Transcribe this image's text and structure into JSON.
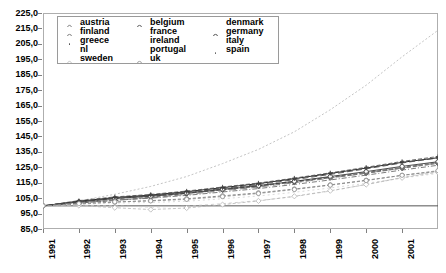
{
  "chart_data": {
    "type": "line",
    "title": "",
    "subtitle": "",
    "xlabel": "",
    "ylabel": "",
    "grid": false,
    "legend_position": "top-left",
    "xlim": [
      1991,
      2002
    ],
    "ylim": [
      85.0,
      225.0
    ],
    "ytick_step": 10.0,
    "y_ticks": [
      "225,0",
      "215,0",
      "205,0",
      "195,0",
      "185,0",
      "175,0",
      "165,0",
      "155,0",
      "145,0",
      "135,0",
      "125,0",
      "115,0",
      "105,0",
      "95,0",
      "85,0"
    ],
    "y_tick_values": [
      225,
      215,
      205,
      195,
      185,
      175,
      165,
      155,
      145,
      135,
      125,
      115,
      105,
      95,
      85
    ],
    "x_ticks": [
      "1991",
      "1992",
      "1993",
      "1994",
      "1995",
      "1996",
      "1997",
      "1998",
      "1999",
      "2000",
      "2001"
    ],
    "x_tick_values": [
      1991,
      1992,
      1993,
      1994,
      1995,
      1996,
      1997,
      1998,
      1999,
      2000,
      2001
    ],
    "x": [
      1991,
      1992,
      1993,
      1994,
      1995,
      1996,
      1997,
      1998,
      1999,
      2000,
      2001,
      2002
    ],
    "series": [
      {
        "name": "austria",
        "marker": "open-diamond",
        "dash": "4,2",
        "color": "#555555",
        "width": 0.8,
        "values": [
          100.0,
          101.8,
          103.5,
          105.6,
          108.0,
          110.3,
          112.7,
          115.4,
          118.2,
          121.1,
          124.4,
          127.5
        ]
      },
      {
        "name": "belgium",
        "marker": "open-circle",
        "dash": "4,2",
        "color": "#444444",
        "width": 0.8,
        "values": [
          100.0,
          102.4,
          104.6,
          106.5,
          108.6,
          110.9,
          113.2,
          115.8,
          118.6,
          121.6,
          124.9,
          128.1
        ]
      },
      {
        "name": "denmark",
        "marker": "none",
        "dash": "2,2",
        "color": "#bdbdbd",
        "width": 0.9,
        "values": [
          100.0,
          103.2,
          107.5,
          112.6,
          119.0,
          127.4,
          136.6,
          148.0,
          162.3,
          178.2,
          196.6,
          213.8
        ]
      },
      {
        "name": "finland",
        "marker": "open-circle",
        "dash": "3,2",
        "color": "#6b6b6b",
        "width": 0.8,
        "values": [
          100.0,
          101.2,
          102.4,
          103.4,
          104.6,
          106.5,
          108.4,
          110.9,
          113.6,
          116.6,
          119.8,
          122.4
        ]
      },
      {
        "name": "france",
        "marker": "none",
        "dash": "5,2,1,2",
        "color": "#5a5a5a",
        "width": 0.8,
        "values": [
          100.0,
          102.0,
          103.6,
          105.0,
          106.8,
          109.0,
          111.2,
          113.9,
          116.8,
          119.9,
          123.2,
          126.3
        ]
      },
      {
        "name": "germany",
        "marker": "open-circle",
        "dash": "none",
        "color": "#3a3a3a",
        "width": 0.9,
        "values": [
          100.0,
          102.6,
          104.8,
          106.2,
          108.2,
          110.6,
          113.0,
          115.9,
          119.0,
          122.2,
          125.6,
          128.6
        ]
      },
      {
        "name": "greece",
        "marker": "plus",
        "dash": "none",
        "color": "#2b2b2b",
        "width": 1.0,
        "values": [
          100.0,
          103.0,
          105.4,
          107.0,
          109.2,
          111.8,
          114.4,
          117.6,
          121.0,
          124.5,
          128.2,
          131.2
        ]
      },
      {
        "name": "ireland",
        "marker": "none",
        "dash": "3,3",
        "color": "#c4c4c4",
        "width": 0.8,
        "values": [
          100.0,
          100.4,
          100.0,
          99.2,
          99.8,
          101.4,
          103.4,
          106.0,
          109.6,
          113.9,
          118.4,
          122.6
        ]
      },
      {
        "name": "italy",
        "marker": "none",
        "dash": "6,3",
        "color": "#4a4a4a",
        "width": 0.9,
        "values": [
          100.0,
          102.8,
          105.0,
          106.6,
          108.8,
          111.2,
          113.8,
          117.0,
          120.4,
          124.0,
          127.8,
          131.0
        ]
      },
      {
        "name": "nl",
        "marker": "none",
        "dash": "2,3",
        "color": "#cfcfcf",
        "width": 0.8,
        "values": [
          100.0,
          101.0,
          101.8,
          102.2,
          103.0,
          104.6,
          106.4,
          108.8,
          111.6,
          114.6,
          118.0,
          121.0
        ]
      },
      {
        "name": "portugal",
        "marker": "none",
        "dash": "7,4",
        "color": "#7a7a7a",
        "width": 0.9,
        "values": [
          100.0,
          102.2,
          103.8,
          105.2,
          107.4,
          109.8,
          112.2,
          115.0,
          118.0,
          121.2,
          124.6,
          127.8
        ]
      },
      {
        "name": "spain",
        "marker": "plus",
        "dash": "4,2",
        "color": "#464646",
        "width": 0.8,
        "values": [
          100.0,
          103.4,
          105.8,
          107.4,
          109.6,
          112.2,
          114.8,
          118.0,
          121.4,
          125.0,
          128.8,
          132.0
        ]
      },
      {
        "name": "sweden",
        "marker": "open-diamond",
        "dash": "3,2",
        "color": "#b5b5b5",
        "width": 0.8,
        "values": [
          100.0,
          100.2,
          98.8,
          97.6,
          98.6,
          100.8,
          103.2,
          106.2,
          109.8,
          113.8,
          118.2,
          121.8
        ]
      },
      {
        "name": "uk",
        "marker": "open-circle",
        "dash": "3,2",
        "color": "#8f8f8f",
        "width": 0.8,
        "values": [
          100.0,
          101.4,
          102.6,
          103.2,
          104.2,
          106.0,
          108.0,
          110.6,
          113.4,
          116.4,
          119.8,
          122.8
        ]
      }
    ]
  },
  "legend": {
    "items": [
      {
        "label": "austria"
      },
      {
        "label": "belgium"
      },
      {
        "label": "denmark"
      },
      {
        "label": "finland"
      },
      {
        "label": "france"
      },
      {
        "label": "germany"
      },
      {
        "label": "greece"
      },
      {
        "label": "ireland"
      },
      {
        "label": "italy"
      },
      {
        "label": "nl"
      },
      {
        "label": "portugal"
      },
      {
        "label": "spain"
      },
      {
        "label": "sweden"
      },
      {
        "label": "uk"
      }
    ]
  },
  "colors": {
    "background": "#ffffff",
    "axis": "#808080",
    "frame": "#aeaeae",
    "text": "#000000",
    "baseline": "#555555"
  }
}
